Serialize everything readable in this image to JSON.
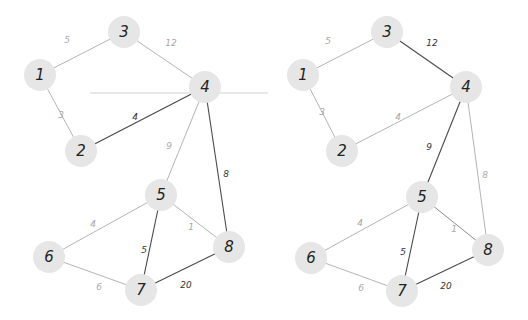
{
  "colors": {
    "background": "#ffffff",
    "node_fill": "#e6e6e6",
    "node_text": "#222222",
    "edge_dark": "#4a4a4a",
    "edge_light": "#b4b4b4",
    "edge_medium": "#8c8c8c",
    "label_dark": "#333333",
    "label_light": "#a8a8a8"
  },
  "artifact_line": {
    "x1": 90,
    "y1": 93,
    "x2": 268,
    "y2": 93,
    "color": "#e2e2e2"
  },
  "graphs": [
    {
      "name": "original-graph",
      "nodes": [
        {
          "id": "1",
          "label": "1",
          "x": 40,
          "y": 75
        },
        {
          "id": "2",
          "label": "2",
          "x": 81,
          "y": 151
        },
        {
          "id": "3",
          "label": "3",
          "x": 124,
          "y": 32
        },
        {
          "id": "4",
          "label": "4",
          "x": 205,
          "y": 87
        },
        {
          "id": "5",
          "label": "5",
          "x": 161,
          "y": 195
        },
        {
          "id": "6",
          "label": "6",
          "x": 49,
          "y": 257
        },
        {
          "id": "7",
          "label": "7",
          "x": 141,
          "y": 290
        },
        {
          "id": "8",
          "label": "8",
          "x": 229,
          "y": 247
        }
      ],
      "edges": [
        {
          "from": "1",
          "to": "3",
          "weight": "5",
          "style": "light",
          "lx": 67,
          "ly": 40
        },
        {
          "from": "3",
          "to": "4",
          "weight": "12",
          "style": "light",
          "lx": 171,
          "ly": 43
        },
        {
          "from": "1",
          "to": "2",
          "weight": "3",
          "style": "light",
          "lx": 61,
          "ly": 115
        },
        {
          "from": "2",
          "to": "4",
          "weight": "4",
          "style": "dark",
          "lx": 135,
          "ly": 117
        },
        {
          "from": "4",
          "to": "5",
          "weight": "9",
          "style": "light",
          "lx": 169,
          "ly": 146
        },
        {
          "from": "4",
          "to": "8",
          "weight": "8",
          "style": "dark",
          "lx": 226,
          "ly": 174
        },
        {
          "from": "5",
          "to": "6",
          "weight": "4",
          "style": "light",
          "lx": 93,
          "ly": 224
        },
        {
          "from": "5",
          "to": "7",
          "weight": "5",
          "style": "dark",
          "lx": 144,
          "ly": 250
        },
        {
          "from": "5",
          "to": "8",
          "weight": "1",
          "style": "light",
          "lx": 191,
          "ly": 227
        },
        {
          "from": "6",
          "to": "7",
          "weight": "6",
          "style": "light",
          "lx": 99,
          "ly": 287
        },
        {
          "from": "7",
          "to": "8",
          "weight": "20",
          "style": "dark",
          "lx": 186,
          "ly": 285
        }
      ]
    },
    {
      "name": "result-graph",
      "nodes": [
        {
          "id": "1",
          "label": "1",
          "x": 303,
          "y": 75
        },
        {
          "id": "2",
          "label": "2",
          "x": 342,
          "y": 151
        },
        {
          "id": "3",
          "label": "3",
          "x": 387,
          "y": 32
        },
        {
          "id": "4",
          "label": "4",
          "x": 466,
          "y": 87
        },
        {
          "id": "5",
          "label": "5",
          "x": 422,
          "y": 197
        },
        {
          "id": "6",
          "label": "6",
          "x": 311,
          "y": 258
        },
        {
          "id": "7",
          "label": "7",
          "x": 402,
          "y": 291
        },
        {
          "id": "8",
          "label": "8",
          "x": 488,
          "y": 250
        }
      ],
      "edges": [
        {
          "from": "1",
          "to": "3",
          "weight": "5",
          "style": "light",
          "lx": 328,
          "ly": 41
        },
        {
          "from": "3",
          "to": "4",
          "weight": "12",
          "style": "dark",
          "lx": 432,
          "ly": 43
        },
        {
          "from": "1",
          "to": "2",
          "weight": "3",
          "style": "light",
          "lx": 322,
          "ly": 112
        },
        {
          "from": "2",
          "to": "4",
          "weight": "4",
          "style": "light",
          "lx": 398,
          "ly": 117
        },
        {
          "from": "4",
          "to": "5",
          "weight": "9",
          "style": "dark",
          "lx": 429,
          "ly": 147
        },
        {
          "from": "4",
          "to": "8",
          "weight": "8",
          "style": "light",
          "lx": 485,
          "ly": 175
        },
        {
          "from": "5",
          "to": "6",
          "weight": "4",
          "style": "light",
          "lx": 360,
          "ly": 223
        },
        {
          "from": "5",
          "to": "7",
          "weight": "5",
          "style": "dark",
          "lx": 403,
          "ly": 252
        },
        {
          "from": "5",
          "to": "8",
          "weight": "1",
          "style": "medium",
          "lx": 454,
          "ly": 229
        },
        {
          "from": "6",
          "to": "7",
          "weight": "6",
          "style": "light",
          "lx": 361,
          "ly": 288
        },
        {
          "from": "7",
          "to": "8",
          "weight": "20",
          "style": "dark",
          "lx": 446,
          "ly": 286
        }
      ]
    }
  ]
}
